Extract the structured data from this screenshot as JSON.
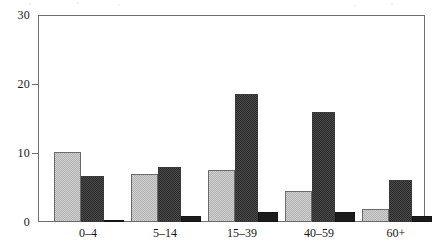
{
  "chart_data": {
    "type": "bar",
    "title": "",
    "subtitle": "",
    "xlabel": "",
    "ylabel": "",
    "categories": [
      "0–4",
      "5–14",
      "15–39",
      "40–59",
      "60+"
    ],
    "series": [
      {
        "name": "series-1",
        "style": "light-checkered",
        "color": "#cfcfcf",
        "values": [
          10.2,
          7.0,
          7.6,
          4.5,
          1.9
        ]
      },
      {
        "name": "series-2",
        "style": "dark-checkered",
        "color": "#4a4a4a",
        "values": [
          6.6,
          8.0,
          18.6,
          15.9,
          6.1
        ]
      },
      {
        "name": "series-3",
        "style": "solid-black",
        "color": "#1b1b1b",
        "values": [
          0.35,
          0.8,
          1.5,
          1.4,
          0.9
        ]
      }
    ],
    "ylim": [
      0,
      30
    ],
    "yticks": [
      0,
      10,
      20,
      30
    ],
    "ytick_labels": [
      "0",
      "10",
      "20",
      "30"
    ],
    "grid": false,
    "legend": "none",
    "frame": "box"
  },
  "axes": {
    "y_ticks": [
      {
        "label": "30",
        "value": 30
      },
      {
        "label": "20",
        "value": 20
      },
      {
        "label": "10",
        "value": 10
      },
      {
        "label": "0",
        "value": 0
      }
    ],
    "x_ticks": [
      {
        "label": "0–4"
      },
      {
        "label": "5–14"
      },
      {
        "label": "15–39"
      },
      {
        "label": "40–59"
      },
      {
        "label": "60+"
      }
    ]
  }
}
